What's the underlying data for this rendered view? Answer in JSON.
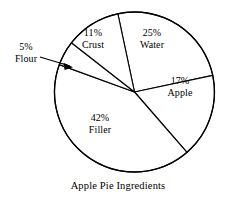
{
  "chart_data": {
    "type": "pie",
    "title": "Apple Pie Ingredients",
    "xlabel": "",
    "ylabel": "",
    "legend_position": "none",
    "grid": false,
    "units": "percent",
    "categories": [
      "Water",
      "Apple",
      "Filler",
      "Flour",
      "Crust"
    ],
    "values": [
      25,
      17,
      42,
      5,
      11
    ],
    "slices": [
      {
        "name": "Water",
        "value": 25,
        "percent_label": "25%",
        "label": "Water",
        "start_angle": -12,
        "sweep": 90,
        "label_placement": "inside"
      },
      {
        "name": "Apple",
        "value": 17,
        "percent_label": "17%",
        "label": "Apple",
        "start_angle": 78,
        "sweep": 61,
        "label_placement": "inside"
      },
      {
        "name": "Filler",
        "value": 42,
        "percent_label": "42%",
        "label": "Filler",
        "start_angle": 139,
        "sweep": 151,
        "label_placement": "inside"
      },
      {
        "name": "Flour",
        "value": 5,
        "percent_label": "5%",
        "label": "Flour",
        "start_angle": 290,
        "sweep": 18,
        "label_placement": "outside-leader"
      },
      {
        "name": "Crust",
        "value": 11,
        "percent_label": "11%",
        "label": "Crust",
        "start_angle": 308,
        "sweep": 40,
        "label_placement": "inside"
      }
    ],
    "total": 100
  },
  "caption": {
    "text": "Apple Pie Ingredients"
  },
  "colors": {
    "stroke": "#000000",
    "fill": "#ffffff",
    "text": "#000000",
    "background": "#ffffff"
  }
}
